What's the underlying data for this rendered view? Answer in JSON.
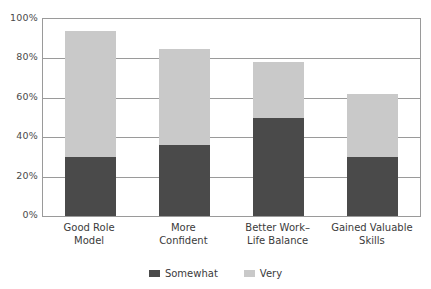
{
  "chart_data": {
    "type": "bar",
    "stacked": true,
    "title": "",
    "subtitle": "",
    "xlabel": "",
    "ylabel": "",
    "categories": [
      "Good Role\nModel",
      "More\nConfident",
      "Better Work–\nLife Balance",
      "Gained Valuable\nSkills"
    ],
    "category_lines": [
      [
        "Good Role",
        "Model"
      ],
      [
        "More",
        "Confident"
      ],
      [
        "Better Work–",
        "Life Balance"
      ],
      [
        "Gained Valuable",
        "Skills"
      ]
    ],
    "series": [
      {
        "name": "Somewhat",
        "color": "#4a4a4a",
        "values": [
          30,
          36,
          50,
          30
        ]
      },
      {
        "name": "Very",
        "color": "#c9c9c9",
        "values": [
          64,
          49,
          28,
          32
        ]
      }
    ],
    "totals": [
      94,
      85,
      78,
      62
    ],
    "ylim": [
      0,
      100
    ],
    "ytick_values": [
      0,
      20,
      40,
      60,
      80,
      100
    ],
    "ytick_labels": [
      "0%",
      "20%",
      "40%",
      "60%",
      "80%",
      "100%"
    ],
    "grid": true,
    "grid_axis": "y",
    "legend_position": "bottom",
    "legend_entries": [
      "Somewhat",
      "Very"
    ],
    "frame_color": "#9a9a9a",
    "background": "#ffffff"
  }
}
